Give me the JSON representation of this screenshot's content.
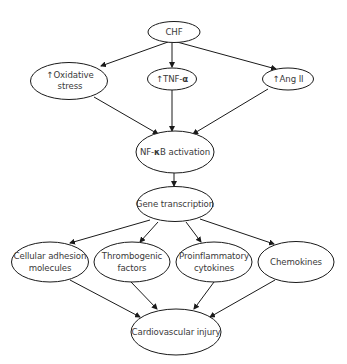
{
  "diagram": {
    "type": "flowchart",
    "nodes": {
      "chf": {
        "label": "CHF"
      },
      "oxidative": {
        "prefix": "↑",
        "line1": "Oxidative",
        "line2": "stress"
      },
      "tnf": {
        "prefix": "↑",
        "text": "TNF-",
        "greek": "α"
      },
      "angii": {
        "prefix": "↑",
        "text": "Ang II"
      },
      "nfkb": {
        "text_before": "NF-",
        "greek": "κ",
        "text_after": "B activation"
      },
      "gene": {
        "label": "Gene transcription"
      },
      "adhesion": {
        "line1": "Cellular adhesion",
        "line2": "molecules"
      },
      "thrombogenic": {
        "line1": "Thrombogenic",
        "line2": "factors"
      },
      "proinflammatory": {
        "line1": "Proinflammatory",
        "line2": "cytokines"
      },
      "chemokines": {
        "label": "Chemokines"
      },
      "injury": {
        "label": "Cardiovascular injury"
      }
    },
    "edges": [
      {
        "from": "CHF",
        "to": "↑Oxidative stress"
      },
      {
        "from": "CHF",
        "to": "↑TNF-α"
      },
      {
        "from": "CHF",
        "to": "↑Ang II"
      },
      {
        "from": "↑Oxidative stress",
        "to": "NF-κB activation"
      },
      {
        "from": "↑TNF-α",
        "to": "NF-κB activation"
      },
      {
        "from": "↑Ang II",
        "to": "NF-κB activation"
      },
      {
        "from": "NF-κB activation",
        "to": "Gene transcription"
      },
      {
        "from": "Gene transcription",
        "to": "Cellular adhesion molecules"
      },
      {
        "from": "Gene transcription",
        "to": "Thrombogenic factors"
      },
      {
        "from": "Gene transcription",
        "to": "Proinflammatory cytokines"
      },
      {
        "from": "Gene transcription",
        "to": "Chemokines"
      },
      {
        "from": "Cellular adhesion molecules",
        "to": "Cardiovascular injury"
      },
      {
        "from": "Thrombogenic factors",
        "to": "Cardiovascular injury"
      },
      {
        "from": "Proinflammatory cytokines",
        "to": "Cardiovascular injury"
      },
      {
        "from": "Chemokines",
        "to": "Cardiovascular injury"
      }
    ],
    "colors": {
      "stroke": "#1a1a1a",
      "text": "#3a3a3a",
      "background": "#ffffff"
    }
  }
}
